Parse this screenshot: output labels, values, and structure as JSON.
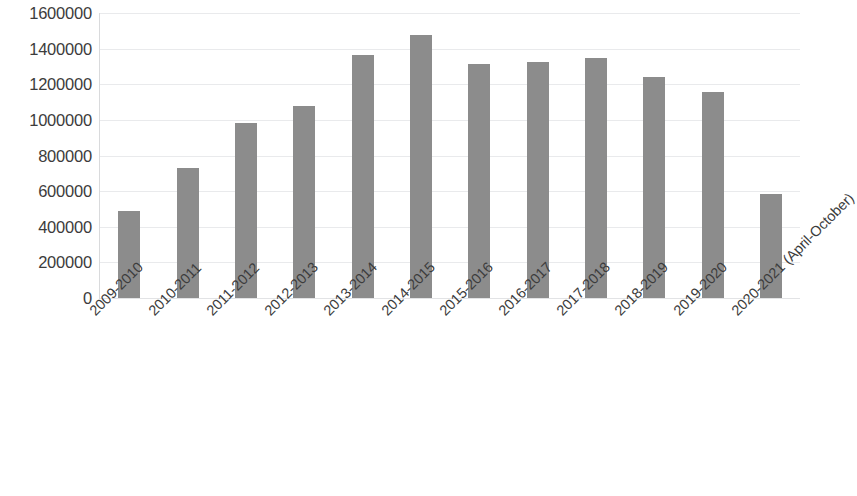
{
  "chart_data": {
    "type": "bar",
    "title": "",
    "xlabel": "",
    "ylabel": "",
    "ylim": [
      0,
      1600000
    ],
    "grid": true,
    "legend": false,
    "bar_color": "#8c8c8c",
    "gridline_color": "#e9eaec",
    "axis_text_color": "#3c3c3c",
    "y_ticks": [
      "1600000",
      "1400000",
      "1200000",
      "1000000",
      "800000",
      "600000",
      "400000",
      "200000",
      "0"
    ],
    "y_tick_values": [
      1600000,
      1400000,
      1200000,
      1000000,
      800000,
      600000,
      400000,
      200000,
      0
    ],
    "categories": [
      "2009-2010",
      "2010-2011",
      "2011-2012",
      "2012-2013",
      "2013-2014",
      "2014-2015",
      "2015-2016",
      "2016-2017",
      "2017-2018",
      "2018-2019",
      "2019-2020",
      "2020-2021 (April-October)"
    ],
    "values": [
      490000,
      730000,
      985000,
      1080000,
      1365000,
      1475000,
      1315000,
      1325000,
      1350000,
      1240000,
      1155000,
      585000
    ]
  }
}
